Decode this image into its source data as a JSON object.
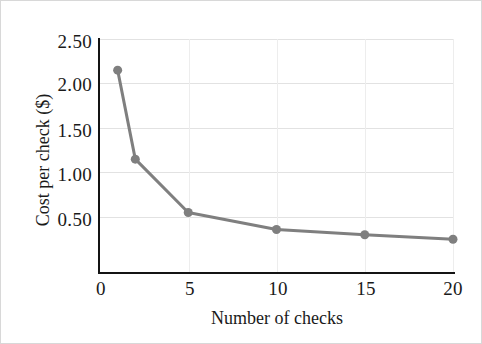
{
  "chart_data": {
    "type": "line",
    "title": "",
    "subtitle": "",
    "xlabel": "Number of checks",
    "ylabel": "Cost per check ($)",
    "x": [
      1,
      2,
      5,
      10,
      15,
      20
    ],
    "values": [
      2.15,
      1.15,
      0.55,
      0.36,
      0.3,
      0.25
    ],
    "series": [
      {
        "name": "Cost per check",
        "x": [
          1,
          2,
          5,
          10,
          15,
          20
        ],
        "values": [
          2.15,
          1.15,
          0.55,
          0.36,
          0.3,
          0.25
        ]
      }
    ],
    "xlim": [
      0,
      20
    ],
    "ylim": [
      0,
      2.5
    ],
    "xticks": [
      0,
      5,
      10,
      15,
      20
    ],
    "xtick_labels": [
      "0",
      "5",
      "10",
      "15",
      "20"
    ],
    "yticks": [
      0.5,
      1.0,
      1.5,
      2.0,
      2.5
    ],
    "ytick_labels": [
      "0.50",
      "1.00",
      "1.50",
      "2.00",
      "2.50"
    ],
    "grid": true,
    "grid_axis": "both",
    "legend": false,
    "legend_position": "none",
    "annotations": [],
    "colors": {
      "series_line": "#7f7f7f",
      "series_marker": "#7f7f7f",
      "gridline": "#e2e2e2",
      "axis": "#141414",
      "text": "#1a1a1a",
      "background": "#ffffff",
      "border": "#d8d8d8"
    },
    "marker": "circle",
    "line_width_px": 3,
    "marker_size_px": 9
  }
}
